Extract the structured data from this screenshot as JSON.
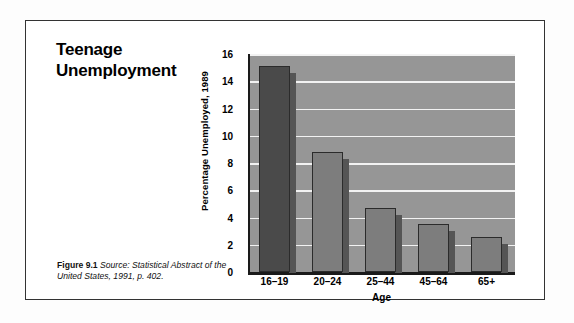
{
  "figure": {
    "title_lines": [
      "Teenage",
      "Unemployment"
    ],
    "caption_label": "Figure 9.1",
    "caption_source": "Source: Statistical Abstract of the United States, 1991, p. 402."
  },
  "colors": {
    "plot_background": "#969696",
    "gridline": "#f2f2f2",
    "bar_default": "#7d7d7d",
    "bar_highlight": "#4a4a4a",
    "bar_outline": "#2b2b2b",
    "bar_shadow": "#555555",
    "axis": "#1a1a1a",
    "frame": "#333333",
    "page_background": "#ffffff"
  },
  "chart_data": {
    "type": "bar",
    "title": "Teenage Unemployment",
    "categories": [
      "16–19",
      "20–24",
      "25–44",
      "45–64",
      "65+"
    ],
    "values": [
      15.1,
      8.8,
      4.7,
      3.5,
      2.6
    ],
    "xlabel": "Age",
    "ylabel": "Percentage Unemployed, 1989",
    "ylim": [
      0,
      16
    ],
    "yticks": [
      0,
      2,
      4,
      6,
      8,
      10,
      12,
      14,
      16
    ],
    "ytick_labels": [
      "0",
      "2",
      "4",
      "6",
      "8",
      "10",
      "12",
      "14",
      "16"
    ],
    "grid": true,
    "legend": false,
    "highlight_index": 0
  }
}
